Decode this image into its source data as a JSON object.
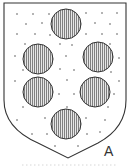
{
  "figure": {
    "label": "A",
    "colors": {
      "outline": "#333333",
      "field_bg": "#ffffff",
      "field_dots": "#555555",
      "roundel_fill": "#e6e6e6",
      "roundel_hatch": "#666666"
    },
    "roundels": [
      {
        "cx": 66,
        "cy": 24,
        "r": 15
      },
      {
        "cx": 38,
        "cy": 59,
        "r": 15
      },
      {
        "cx": 98,
        "cy": 57,
        "r": 15
      },
      {
        "cx": 38,
        "cy": 92,
        "r": 15
      },
      {
        "cx": 95,
        "cy": 92,
        "r": 15
      },
      {
        "cx": 66,
        "cy": 124,
        "r": 15
      }
    ]
  }
}
